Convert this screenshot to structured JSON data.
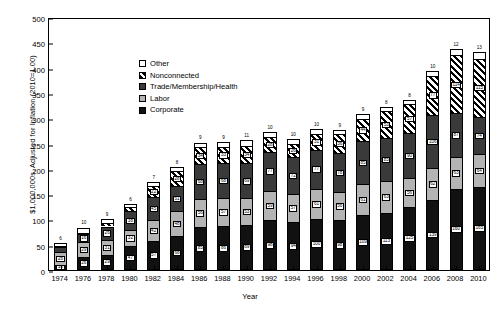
{
  "chart_data": {
    "type": "bar",
    "title": "",
    "xlabel": "Year",
    "ylabel": "$1,000,000s, Adjusted for Inflation (2010=1.00)",
    "ylim": [
      0,
      500
    ],
    "yticks": [
      0,
      50,
      100,
      150,
      200,
      250,
      300,
      350,
      400,
      450,
      500
    ],
    "grid": false,
    "stacked": true,
    "legend_position": "upper-left",
    "categories": [
      "1974",
      "1976",
      "1978",
      "1980",
      "1982",
      "1984",
      "1986",
      "1988",
      "1990",
      "1992",
      "1994",
      "1996",
      "1998",
      "2000",
      "2002",
      "2004",
      "2006",
      "2008",
      "2010"
    ],
    "series": [
      {
        "name": "Corporate",
        "color": "#111111",
        "pattern": "solid-black",
        "values": [
          10,
          26,
          29,
          47,
          57,
          68,
          85,
          86,
          89,
          98,
          94,
          100,
          98,
          109,
          113,
          125,
          139,
          160,
          165
        ]
      },
      {
        "name": "Labor",
        "color": "#b4b4b4",
        "pattern": "solid-gray",
        "values": [
          26,
          29,
          31,
          32,
          42,
          48,
          56,
          57,
          53,
          59,
          57,
          61,
          56,
          61,
          63,
          56,
          62,
          63,
          64
        ]
      },
      {
        "name": "Trade/Membership/Health",
        "color": "#3a3a3a",
        "pattern": "solid-dark-gray",
        "values": [
          9,
          16,
          26,
          38,
          45,
          51,
          68,
          68,
          69,
          77,
          72,
          77,
          78,
          85,
          85,
          90,
          106,
          87,
          74
        ]
      },
      {
        "name": "Nonconnected",
        "color": "#000000",
        "pattern": "diagonal-hatch",
        "values": [
          2,
          3,
          6,
          8,
          22,
          28,
          34,
          33,
          34,
          28,
          26,
          31,
          36,
          44,
          53,
          57,
          77,
          114,
          115
        ]
      },
      {
        "name": "Other",
        "color": "#ffffff",
        "pattern": "white",
        "values": [
          6,
          10,
          9,
          6,
          7,
          8,
          9,
          9,
          11,
          10,
          10,
          10,
          9,
          9,
          8,
          8,
          10,
          12,
          13
        ]
      }
    ],
    "top_labels": [
      6,
      10,
      9,
      6,
      7,
      8,
      9,
      9,
      11,
      10,
      10,
      10,
      9,
      9,
      8,
      8,
      10,
      12,
      13
    ]
  },
  "legend": {
    "items": [
      {
        "label": "Other",
        "swatch": "other"
      },
      {
        "label": "Nonconnected",
        "swatch": "nonconnected"
      },
      {
        "label": "Trade/Membership/Health",
        "swatch": "trade"
      },
      {
        "label": "Labor",
        "swatch": "labor"
      },
      {
        "label": "Corporate",
        "swatch": "corporate"
      }
    ]
  }
}
